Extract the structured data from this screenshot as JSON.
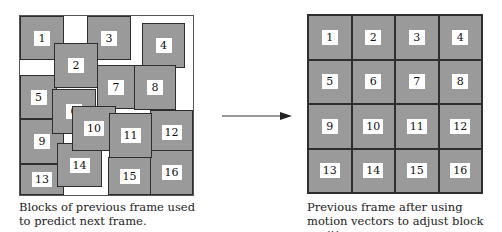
{
  "left_panel": {
    "caption": "Blocks of previous frame used to predict next frame.",
    "blocks": [
      {
        "label": "1",
        "x": 20,
        "y": 16,
        "w": 44,
        "h": 44
      },
      {
        "label": "3",
        "x": 87,
        "y": 16,
        "w": 44,
        "h": 44
      },
      {
        "label": "4",
        "x": 142,
        "y": 23,
        "w": 43,
        "h": 45
      },
      {
        "label": "5",
        "x": 20,
        "y": 75,
        "w": 37,
        "h": 44
      },
      {
        "label": "9",
        "x": 20,
        "y": 119,
        "w": 44,
        "h": 45
      },
      {
        "label": "13",
        "x": 20,
        "y": 164,
        "w": 44,
        "h": 31
      },
      {
        "label": "7",
        "x": 97,
        "y": 65,
        "w": 38,
        "h": 44
      },
      {
        "label": "8",
        "x": 134,
        "y": 65,
        "w": 42,
        "h": 45
      },
      {
        "label": "12",
        "x": 150,
        "y": 110,
        "w": 43,
        "h": 44
      },
      {
        "label": "16",
        "x": 150,
        "y": 150,
        "w": 43,
        "h": 45
      },
      {
        "label": "15",
        "x": 108,
        "y": 157,
        "w": 43,
        "h": 38
      },
      {
        "label": "2",
        "x": 54,
        "y": 43,
        "w": 44,
        "h": 45
      },
      {
        "label": "6",
        "x": 52,
        "y": 89,
        "w": 44,
        "h": 45
      },
      {
        "label": "14",
        "x": 57,
        "y": 143,
        "w": 45,
        "h": 44
      },
      {
        "label": "10",
        "x": 72,
        "y": 106,
        "w": 44,
        "h": 45
      },
      {
        "label": "11",
        "x": 109,
        "y": 113,
        "w": 43,
        "h": 45
      }
    ]
  },
  "arrow": {
    "direction": "right"
  },
  "right_panel": {
    "caption": "Previous frame after using motion vectors to adjust block positions.",
    "cells": [
      "1",
      "2",
      "3",
      "4",
      "5",
      "6",
      "7",
      "8",
      "9",
      "10",
      "11",
      "12",
      "13",
      "14",
      "15",
      "16"
    ]
  },
  "colors": {
    "block_fill": "#9a9a9a",
    "block_border": "#2e2e2e",
    "label_bg": "#ffffff"
  }
}
